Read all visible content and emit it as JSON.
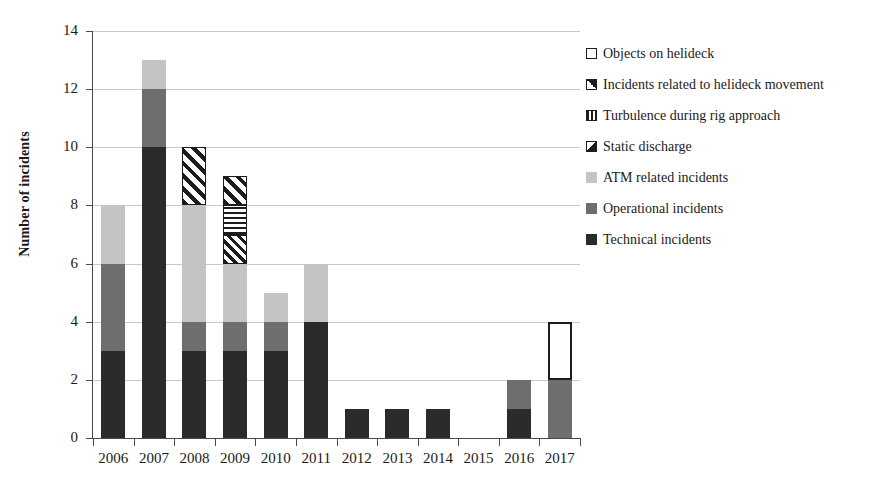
{
  "chart_data": {
    "type": "bar",
    "title": "",
    "subtitle": "",
    "xlabel": "",
    "ylabel": "Number of incidents",
    "ylim": [
      0,
      14
    ],
    "ytick_step": 2,
    "yticks": [
      0,
      2,
      4,
      6,
      8,
      10,
      12,
      14
    ],
    "grid": true,
    "stacked": true,
    "legend_position": "right",
    "categories": [
      "2006",
      "2007",
      "2008",
      "2009",
      "2010",
      "2011",
      "2012",
      "2013",
      "2014",
      "2015",
      "2016",
      "2017"
    ],
    "series": [
      {
        "name": "Technical incidents",
        "key": "technical",
        "swatch": "sw-technical",
        "fill": "fill-technical",
        "color": "#2b2b2b",
        "values": [
          3,
          10,
          3,
          3,
          3,
          4,
          1,
          1,
          1,
          0,
          1,
          0
        ]
      },
      {
        "name": "Operational incidents",
        "key": "operational",
        "swatch": "sw-operational",
        "fill": "fill-operational",
        "color": "#6e6e6e",
        "values": [
          3,
          2,
          1,
          1,
          1,
          0,
          0,
          0,
          0,
          0,
          1,
          2
        ]
      },
      {
        "name": "ATM related incidents",
        "key": "atm",
        "swatch": "sw-atm",
        "fill": "fill-atm",
        "color": "#c4c4c4",
        "values": [
          2,
          1,
          4,
          2,
          1,
          2,
          0,
          0,
          0,
          0,
          0,
          0
        ]
      },
      {
        "name": "Static discharge",
        "key": "static",
        "swatch": "sw-static",
        "fill": "fill-static",
        "color": "#1c1c1c",
        "values": [
          0,
          0,
          0,
          1,
          0,
          0,
          0,
          0,
          0,
          0,
          0,
          0
        ]
      },
      {
        "name": "Turbulence during rig approach",
        "key": "turbulence",
        "swatch": "sw-turbulence",
        "fill": "fill-turbulence",
        "color": "#1c1c1c",
        "values": [
          0,
          0,
          0,
          1,
          0,
          0,
          0,
          0,
          0,
          0,
          0,
          0
        ]
      },
      {
        "name": "Incidents related to helideck movement",
        "key": "movement",
        "swatch": "sw-movement",
        "fill": "fill-movement",
        "color": "#1c1c1c",
        "values": [
          0,
          0,
          2,
          1,
          0,
          0,
          0,
          0,
          0,
          0,
          0,
          0
        ]
      },
      {
        "name": "Objects on helideck",
        "key": "objects",
        "swatch": "sw-objects",
        "fill": "fill-objects",
        "color": "#ffffff",
        "values": [
          0,
          0,
          0,
          0,
          0,
          0,
          0,
          0,
          0,
          0,
          0,
          2
        ]
      }
    ],
    "totals": [
      8,
      13,
      10,
      9,
      5,
      6,
      1,
      1,
      1,
      0,
      2,
      4
    ],
    "legend_order": [
      "Objects on helideck",
      "Incidents related to helideck movement",
      "Turbulence during rig approach",
      "Static discharge",
      "ATM related incidents",
      "Operational incidents",
      "Technical incidents"
    ]
  }
}
